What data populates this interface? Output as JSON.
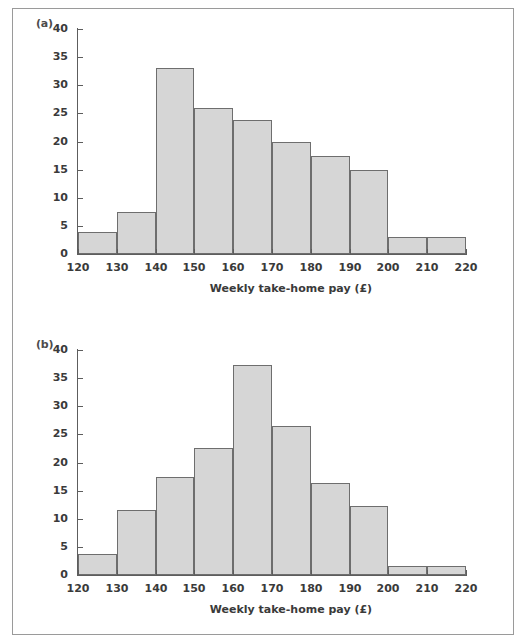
{
  "figure": {
    "width": 526,
    "height": 643,
    "background": "#ffffff",
    "frame_color": "#9a9a9a",
    "bar_fill": "#d6d6d6",
    "bar_stroke": "#6e6e6e",
    "axis_color": "#5d5d5d",
    "text_color": "#3a3a3a"
  },
  "panels": [
    {
      "label": "(a)"
    },
    {
      "label": "(b)"
    }
  ],
  "axes": {
    "y_ticks": [
      0,
      5,
      10,
      15,
      20,
      25,
      30,
      35,
      40
    ],
    "y_tick_labels": [
      "0",
      "5",
      "10",
      "15",
      "20",
      "25",
      "30",
      "35",
      "40"
    ],
    "x_ticks": [
      120,
      130,
      140,
      150,
      160,
      170,
      180,
      190,
      200,
      210,
      220
    ],
    "x_tick_labels": [
      "120",
      "130",
      "140",
      "150",
      "160",
      "170",
      "180",
      "190",
      "200",
      "210",
      "220"
    ],
    "x_title": "Weekly take-home pay (£)",
    "y_title": ""
  },
  "chart_data": [
    {
      "type": "bar",
      "title": "(a)",
      "xlabel": "Weekly take-home pay (£)",
      "ylabel": "",
      "xlim": [
        120,
        220
      ],
      "ylim": [
        0,
        40
      ],
      "grid": false,
      "legend": null,
      "bin_width": 10,
      "bin_edges": [
        120,
        130,
        140,
        150,
        160,
        170,
        180,
        190,
        200,
        210,
        220
      ],
      "categories": [
        "120-130",
        "130-140",
        "140-150",
        "150-160",
        "160-170",
        "170-180",
        "180-190",
        "190-200",
        "200-210",
        "210-220"
      ],
      "values": [
        4,
        7.5,
        33,
        26,
        23.8,
        20,
        17.5,
        15,
        3,
        3
      ]
    },
    {
      "type": "bar",
      "title": "(b)",
      "xlabel": "Weekly take-home pay (£)",
      "ylabel": "",
      "xlim": [
        120,
        220
      ],
      "ylim": [
        0,
        40
      ],
      "grid": false,
      "legend": null,
      "bin_width": 10,
      "bin_edges": [
        120,
        130,
        140,
        150,
        160,
        170,
        180,
        190,
        200,
        210,
        220
      ],
      "categories": [
        "120-130",
        "130-140",
        "140-150",
        "150-160",
        "160-170",
        "170-180",
        "180-190",
        "190-200",
        "200-210",
        "210-220"
      ],
      "values": [
        3.8,
        11.5,
        17.5,
        22.5,
        37.3,
        26.5,
        16.3,
        12.2,
        1.6,
        1.6
      ]
    }
  ]
}
